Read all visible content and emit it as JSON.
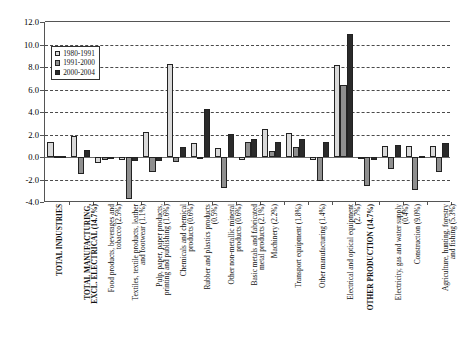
{
  "chart_data": {
    "type": "bar",
    "title": "",
    "subtitle": "",
    "xlabel": "",
    "ylabel": "",
    "ylim": [
      -4.0,
      12.0
    ],
    "ytick_values": [
      -4.0,
      -2.0,
      0.0,
      2.0,
      4.0,
      6.0,
      8.0,
      10.0,
      12.0
    ],
    "ytick_labels": [
      "-4.0",
      "-2.0",
      "0.0",
      "2.0",
      "4.0",
      "6.0",
      "8.0",
      "10.0",
      "12.0"
    ],
    "grid": "horizontal-dashed",
    "legend_position": "inside-upper-left",
    "categories": [
      "TOTAL INDUSTRIES",
      "TOTAL MANUFACTURING, EXCL. ELECTRICAL (14.7%)",
      "Food products, beverages and tobacco (2.5%)",
      "Textiles, textile products, leather and footwear (1.1%)",
      "Pulp, paper, paper products, printing and publishing (1.6%)",
      "Chemicals and chemical products (0.6%)",
      "Rubber and plastics products (0.5%)",
      "Other non-metallic mineral products (0.6%)",
      "Basic metals and fabricated metal products (2.1%)",
      "Machinery (2.2%)",
      "Transport equipment (1.8%)",
      "Other manufacturing (1.4%)",
      "Electrical and optical equipment (2.7%)",
      "OTHER PRODUCTION (14.7%)",
      "Electricity, gas and water supply (0.4%)",
      "Construction (9.0%)",
      "Agriculture, hunting, forestry and fishing (5.3%)"
    ],
    "category_lines": [
      [
        "TOTAL INDUSTRIES"
      ],
      [
        "TOTAL MANUFACTURING,",
        "EXCL. ELECTRICAL (14.7%)"
      ],
      [
        "Food products, beverages and",
        "tobacco (2.5%)"
      ],
      [
        "Textiles, textile products, leather",
        "and footwear (1.1%)"
      ],
      [
        "Pulp, paper, paper products,",
        "printing and publishing (1.6%)"
      ],
      [
        "Chemicals and chemical",
        "products (0.6%)"
      ],
      [
        "Rubber and plastics products",
        "(0.5%)"
      ],
      [
        "Other non-metallic mineral",
        "products (0.6%)"
      ],
      [
        "Basic metals and fabricated",
        "metal products (2.1%)"
      ],
      [
        "Machinery (2.2%)"
      ],
      [
        "Transport equipment (1.8%)"
      ],
      [
        "Other manufacturing (1.4%)"
      ],
      [
        "Electrical and optical equipment",
        "(2.7%)"
      ],
      [
        "OTHER PRODUCTION (14.7%)"
      ],
      [
        "Electricity, gas and water supply",
        "(0.4%)"
      ],
      [
        "Construction (9.0%)"
      ],
      [
        "Agriculture, hunting, forestry",
        "and fishing (5.3%)"
      ]
    ],
    "category_bold": [
      true,
      true,
      false,
      false,
      false,
      false,
      false,
      false,
      false,
      false,
      false,
      false,
      false,
      true,
      false,
      false,
      false
    ],
    "series": [
      {
        "name": "1980-1991",
        "color": "#d9d9d9",
        "values": [
          1.3,
          1.85,
          -0.55,
          -0.25,
          2.2,
          8.3,
          1.25,
          0.8,
          -0.3,
          2.45,
          2.1,
          -0.25,
          8.2,
          -0.05,
          1.0,
          1.0,
          1.0
        ]
      },
      {
        "name": "1991-2000",
        "color": "#8f8f8f",
        "values": [
          0.1,
          -1.55,
          -0.3,
          -3.7,
          -1.35,
          -0.4,
          -0.05,
          -2.75,
          1.35,
          0.55,
          0.85,
          -2.15,
          6.4,
          -2.6,
          -1.1,
          -2.95,
          -1.35
        ]
      },
      {
        "name": "2000-2004",
        "color": "#2b2b2b",
        "values": [
          0.05,
          0.6,
          -0.2,
          -0.35,
          -0.35,
          0.85,
          4.3,
          2.05,
          1.6,
          1.35,
          1.6,
          1.35,
          10.9,
          -0.3,
          1.1,
          0.1,
          1.25
        ]
      }
    ]
  },
  "legend": {
    "items": [
      {
        "label": "1980-1991"
      },
      {
        "label": "1991-2000"
      },
      {
        "label": "2000-2004"
      }
    ]
  }
}
